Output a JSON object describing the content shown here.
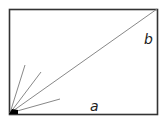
{
  "diagram": {
    "rectangle": {
      "x": 9,
      "y": 9,
      "width": 148,
      "height": 105,
      "stroke": "#333333"
    },
    "origin": {
      "x": 10,
      "y": 113
    },
    "diagonal_end": {
      "x": 157,
      "y": 9
    },
    "rays": [
      {
        "x": 25,
        "y": 65
      },
      {
        "x": 41,
        "y": 72
      },
      {
        "x": 60,
        "y": 99
      }
    ],
    "labels": {
      "a": "a",
      "b": "b"
    },
    "label_positions": {
      "a": {
        "x": 90,
        "y": 111
      },
      "b": {
        "x": 144,
        "y": 44
      }
    },
    "line_color": "#888888",
    "corner_fill": "#000000"
  }
}
